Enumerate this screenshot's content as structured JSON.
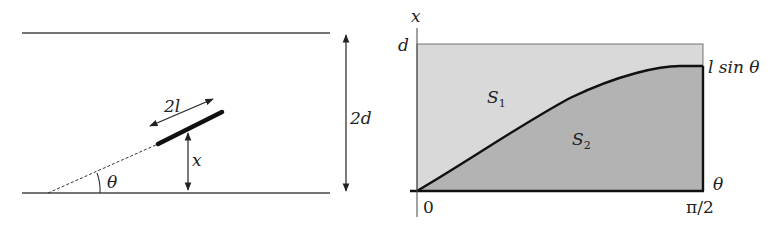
{
  "left_diagram": {
    "labels": {
      "needle_length": "2l",
      "height": "x",
      "angle": "θ",
      "gap": "2d"
    }
  },
  "right_diagram": {
    "labels": {
      "y_axis": "x",
      "x_axis": "θ",
      "y_top": "d",
      "curve": "l sin θ",
      "region_upper": "S",
      "region_upper_sub": "1",
      "region_lower": "S",
      "region_lower_sub": "2",
      "x_start": "0",
      "x_end": "π/2"
    },
    "colors": {
      "upper_fill": "#d9d9d9",
      "lower_fill": "#b3b3b3",
      "line": "#111111"
    }
  }
}
